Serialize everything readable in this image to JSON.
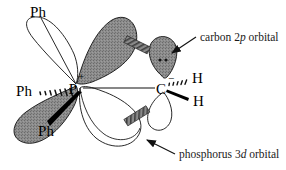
{
  "figure": {
    "atoms": {
      "phosphorus": {
        "symbol": "P",
        "charge": "+",
        "name": "phosphorus-atom"
      },
      "carbon": {
        "symbol": "C",
        "charge": "−",
        "name": "carbon-atom"
      },
      "hydrogen_top": {
        "symbol": "H"
      },
      "hydrogen_bottom": {
        "symbol": "H"
      }
    },
    "substituents": [
      {
        "label": "Ph",
        "position": "top-left",
        "bond": "plain"
      },
      {
        "label": "Ph",
        "position": "left",
        "bond": "hashed-wedge"
      },
      {
        "label": "Ph",
        "position": "bottom-left",
        "bond": "solid-wedge"
      }
    ],
    "annotations": [
      {
        "id": "carbon-2p",
        "text_before": "carbon 2",
        "text_italic": "p",
        "text_after": " orbital",
        "full": "carbon 2p orbital",
        "arrow": "points-down-left"
      },
      {
        "id": "phosphorus-3d",
        "text_before": "phosphorus 3",
        "text_italic": "d",
        "text_after": " orbital",
        "full": "phosphorus 3d orbital",
        "arrow": "points-up-left"
      }
    ],
    "lone_pair": {
      "name": "lone-pair-dots",
      "count": 2
    },
    "colors": {
      "orbital_filled": "#848484",
      "orbital_outline": "#000000",
      "orbital_empty": "#ffffff",
      "bond": "#000000",
      "overlap_hatch": "#6e6e6e",
      "text": "#000000",
      "background": "#ffffff"
    },
    "orbitals": [
      {
        "name": "phenyl-lobe-top-left",
        "fill": "empty"
      },
      {
        "name": "phosphorus-3d-lobe-upper",
        "fill": "filled"
      },
      {
        "name": "phosphorus-3d-lobe-lower",
        "fill": "empty"
      },
      {
        "name": "phenyl-lobe-bottom-left",
        "fill": "filled"
      },
      {
        "name": "carbon-2p-lobe-upper",
        "fill": "filled"
      },
      {
        "name": "carbon-2p-lobe-lower",
        "fill": "empty"
      }
    ]
  }
}
